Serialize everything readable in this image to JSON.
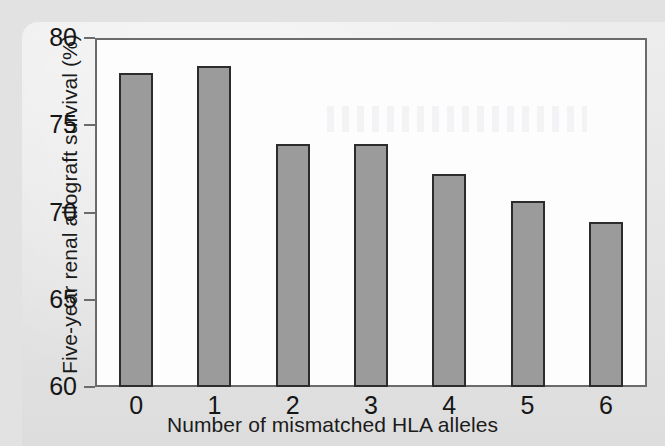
{
  "figure": {
    "axes": {
      "ylabel": "Five-year renal allograft survival (%)",
      "xlabel": "Number of mismatched HLA alleles"
    }
  },
  "chart_data": {
    "type": "bar",
    "title": "",
    "xlabel": "Number of mismatched HLA alleles",
    "ylabel": "Five-year renal allograft survival (%)",
    "categories": [
      "0",
      "1",
      "2",
      "3",
      "4",
      "5",
      "6"
    ],
    "values": [
      78.1,
      78.5,
      74.0,
      74.0,
      72.3,
      70.7,
      69.5
    ],
    "ylim": [
      60,
      80
    ],
    "yticks": [
      60,
      65,
      70,
      75,
      80
    ],
    "yticklabels": [
      "60",
      "65",
      "70",
      "75",
      "80"
    ],
    "grid": false,
    "legend": null,
    "bar_color": "#9b9b9b",
    "bar_edge_color": "#2c2c2c",
    "axis_color": "#6b6b6b",
    "plot_background": "#fdfdfd",
    "page_background": "#e4e4e4"
  }
}
